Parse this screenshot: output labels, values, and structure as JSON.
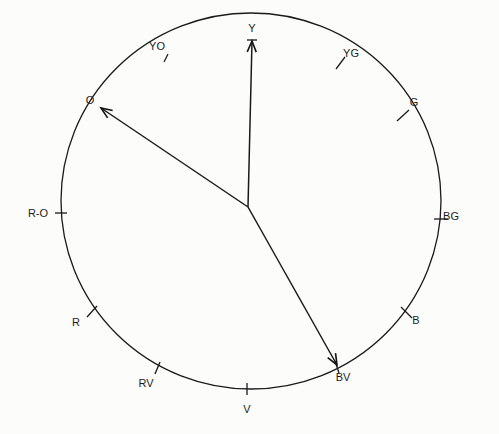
{
  "diagram": {
    "type": "hue-circle",
    "center": {
      "x": 248,
      "y": 207
    },
    "ellipse": {
      "cx": 251,
      "cy": 201,
      "rx": 190,
      "ry": 188
    },
    "colors": {
      "stroke": "#1a1a1a",
      "background": "#fcfcfb",
      "text": "#1c1c1c"
    },
    "hues": [
      {
        "id": "Y",
        "label": "Y",
        "tick": {
          "x1": 247,
          "y1": 40,
          "x2": 257,
          "y2": 40
        },
        "label_pos": {
          "x": 252,
          "y": 32
        }
      },
      {
        "id": "YG",
        "label": "YG",
        "tick": {
          "x1": 336,
          "y1": 69,
          "x2": 345,
          "y2": 57
        },
        "label_pos": {
          "x": 351,
          "y": 57
        }
      },
      {
        "id": "G",
        "label": "G",
        "tick": {
          "x1": 397,
          "y1": 121,
          "x2": 409,
          "y2": 110
        },
        "label_pos": {
          "x": 414,
          "y": 106
        }
      },
      {
        "id": "BG",
        "label": "BG",
        "tick": {
          "x1": 434,
          "y1": 219,
          "x2": 448,
          "y2": 219
        },
        "label_pos": {
          "x": 451,
          "y": 220
        }
      },
      {
        "id": "B",
        "label": "B",
        "tick": {
          "x1": 401,
          "y1": 307,
          "x2": 412,
          "y2": 318
        },
        "label_pos": {
          "x": 416,
          "y": 324
        }
      },
      {
        "id": "BV",
        "label": "BV",
        "tick": {
          "x1": 335,
          "y1": 361,
          "x2": 339,
          "y2": 373
        },
        "label_pos": {
          "x": 343,
          "y": 381
        }
      },
      {
        "id": "V",
        "label": "V",
        "tick": {
          "x1": 247,
          "y1": 383,
          "x2": 247,
          "y2": 395
        },
        "label_pos": {
          "x": 247,
          "y": 413
        }
      },
      {
        "id": "RV",
        "label": "RV",
        "tick": {
          "x1": 155,
          "y1": 374,
          "x2": 160,
          "y2": 362
        },
        "label_pos": {
          "x": 146,
          "y": 387
        }
      },
      {
        "id": "R",
        "label": "R",
        "tick": {
          "x1": 87,
          "y1": 317,
          "x2": 97,
          "y2": 306
        },
        "label_pos": {
          "x": 76,
          "y": 326
        }
      },
      {
        "id": "R-O",
        "label": "R-O",
        "tick": {
          "x1": 55,
          "y1": 213,
          "x2": 67,
          "y2": 213
        },
        "label_pos": {
          "x": 38,
          "y": 217
        }
      },
      {
        "id": "O",
        "label": "O",
        "tick": null,
        "label_pos": {
          "x": 90,
          "y": 104
        }
      },
      {
        "id": "YO",
        "label": "YO",
        "tick": {
          "x1": 164,
          "y1": 62,
          "x2": 168,
          "y2": 54
        },
        "label_pos": {
          "x": 157,
          "y": 50
        }
      }
    ],
    "vectors": [
      {
        "id": "vector-to-Y",
        "target": "Y",
        "from": {
          "x": 248,
          "y": 207
        },
        "to": {
          "x": 252,
          "y": 41
        }
      },
      {
        "id": "vector-to-O",
        "target": "O",
        "from": {
          "x": 248,
          "y": 207
        },
        "to": {
          "x": 101,
          "y": 108
        }
      },
      {
        "id": "vector-to-BV",
        "target": "BV",
        "from": {
          "x": 248,
          "y": 207
        },
        "to": {
          "x": 337,
          "y": 365
        }
      }
    ]
  }
}
